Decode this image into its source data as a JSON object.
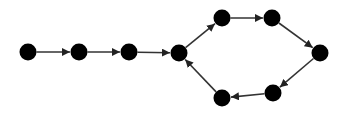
{
  "diagram": {
    "type": "directed-graph",
    "colors": {
      "node": "#000000",
      "edge": "#333333",
      "background": "#ffffff"
    },
    "node_radius": 8.5,
    "nodes": [
      {
        "id": "n1",
        "x": 28,
        "y": 52
      },
      {
        "id": "n2",
        "x": 79,
        "y": 52
      },
      {
        "id": "n3",
        "x": 129,
        "y": 52
      },
      {
        "id": "n4",
        "x": 179,
        "y": 53
      },
      {
        "id": "n5",
        "x": 222,
        "y": 18
      },
      {
        "id": "n6",
        "x": 272,
        "y": 18
      },
      {
        "id": "n7",
        "x": 320,
        "y": 53
      },
      {
        "id": "n8",
        "x": 273,
        "y": 93
      },
      {
        "id": "n9",
        "x": 222,
        "y": 98
      }
    ],
    "edges": [
      {
        "from": "n1",
        "to": "n2"
      },
      {
        "from": "n2",
        "to": "n3"
      },
      {
        "from": "n3",
        "to": "n4"
      },
      {
        "from": "n4",
        "to": "n5"
      },
      {
        "from": "n5",
        "to": "n6"
      },
      {
        "from": "n6",
        "to": "n7"
      },
      {
        "from": "n7",
        "to": "n8"
      },
      {
        "from": "n8",
        "to": "n9"
      },
      {
        "from": "n9",
        "to": "n4"
      }
    ]
  }
}
